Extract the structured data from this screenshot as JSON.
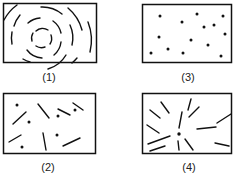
{
  "panels": [
    {
      "id": "1",
      "label": "(1)",
      "description": "concentric broken arcs (circular ordering)"
    },
    {
      "id": "3",
      "label": "(3)",
      "description": "randomly scattered dots"
    },
    {
      "id": "2",
      "label": "(2)",
      "description": "random dots and randomly oriented short lines"
    },
    {
      "id": "4",
      "label": "(4)",
      "description": "short lines radiating from a central dot"
    }
  ],
  "colors": {
    "stroke": "#111111",
    "background": "#ffffff"
  }
}
